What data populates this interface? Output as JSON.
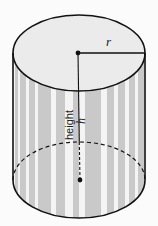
{
  "diagram": {
    "labels": {
      "radius": "r",
      "height_word": "height",
      "height_symbol": "h"
    },
    "colors": {
      "background": "#fbfbfb",
      "top_face": "#ebebeb",
      "stripe_gray": "#c9c9c9",
      "stripe_white": "#f4f4f4",
      "outline": "#111111"
    },
    "stripes": [
      {
        "x": 15,
        "w": 3
      },
      {
        "x": 20,
        "w": 6
      },
      {
        "x": 29,
        "w": 6
      },
      {
        "x": 38,
        "w": 13
      },
      {
        "x": 56,
        "w": 9
      },
      {
        "x": 73,
        "w": 6
      },
      {
        "x": 85,
        "w": 16
      },
      {
        "x": 107,
        "w": 7
      },
      {
        "x": 118,
        "w": 7
      },
      {
        "x": 129,
        "w": 6
      },
      {
        "x": 138,
        "w": 6
      }
    ]
  }
}
